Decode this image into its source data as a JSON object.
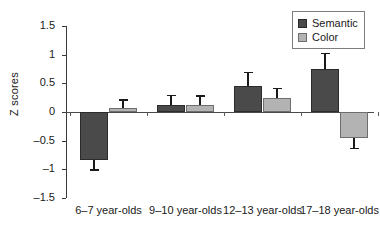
{
  "chart_data": {
    "type": "bar",
    "title": "",
    "xlabel": "",
    "ylabel": "Z scores",
    "ylim": [
      -1.5,
      1.5
    ],
    "ytick_labels": [
      "1.5",
      "1",
      "0.5",
      "0",
      "–0.5",
      "–1",
      "–1.5"
    ],
    "ytick_values": [
      1.5,
      1,
      0.5,
      0,
      -0.5,
      -1,
      -1.5
    ],
    "grid": false,
    "legend_position": "top-right",
    "categories": [
      "6–7 year-olds",
      "9–10 year-olds",
      "12–13 year-olds",
      "17–18 year-olds"
    ],
    "series": [
      {
        "name": "Semantic",
        "color": "#4a4a4a",
        "values": [
          -0.83,
          0.13,
          0.45,
          0.75
        ],
        "errors": [
          0.17,
          0.17,
          0.25,
          0.28
        ]
      },
      {
        "name": "Color",
        "color": "#b3b3b3",
        "values": [
          0.07,
          0.12,
          0.25,
          -0.45
        ],
        "errors": [
          0.15,
          0.17,
          0.17,
          0.17
        ]
      }
    ]
  },
  "legend": {
    "items": [
      {
        "label": "Semantic",
        "swatch": "semantic-swatch"
      },
      {
        "label": "Color",
        "swatch": "color-swatch"
      }
    ]
  }
}
